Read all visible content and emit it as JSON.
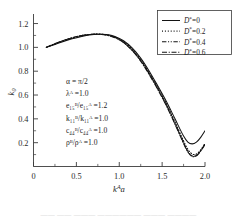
{
  "chart_data": {
    "type": "line",
    "title": "",
    "xlabel": "k^A a",
    "ylabel": "k0",
    "xlim": [
      0,
      2.0
    ],
    "ylim": [
      0.0,
      1.28
    ],
    "grid": false,
    "legend_position": "top-right",
    "x_ticks": [
      "0",
      "0.5",
      "1.0",
      "1.5",
      "2.0"
    ],
    "x_tick_values": [
      0,
      0.5,
      1.0,
      1.5,
      2.0
    ],
    "y_ticks": [
      "0.2",
      "0.4",
      "0.6",
      "0.8",
      "1.0",
      "1.2"
    ],
    "y_tick_values": [
      0.2,
      0.4,
      0.6,
      0.8,
      1.0,
      1.2
    ],
    "x": [
      0.15,
      0.25,
      0.35,
      0.45,
      0.55,
      0.65,
      0.75,
      0.85,
      0.95,
      1.05,
      1.15,
      1.25,
      1.35,
      1.45,
      1.55,
      1.65,
      1.75,
      1.8,
      1.85,
      1.9,
      1.95,
      2.0
    ],
    "series": [
      {
        "name": "D*=0",
        "style": "solid",
        "values": [
          1.0,
          1.025,
          1.05,
          1.072,
          1.09,
          1.103,
          1.11,
          1.108,
          1.092,
          1.055,
          0.995,
          0.91,
          0.8,
          0.675,
          0.545,
          0.4,
          0.255,
          0.205,
          0.19,
          0.205,
          0.245,
          0.3
        ]
      },
      {
        "name": "D*=0.2",
        "style": "dotted",
        "values": [
          1.0,
          1.028,
          1.055,
          1.078,
          1.095,
          1.107,
          1.112,
          1.107,
          1.088,
          1.048,
          0.985,
          0.898,
          0.787,
          0.662,
          0.528,
          0.375,
          0.215,
          0.145,
          0.105,
          0.105,
          0.14,
          0.195
        ]
      },
      {
        "name": "D*=0.4",
        "style": "dashdotdot",
        "values": [
          1.0,
          1.03,
          1.057,
          1.08,
          1.097,
          1.108,
          1.111,
          1.104,
          1.084,
          1.043,
          0.978,
          0.89,
          0.778,
          0.652,
          0.517,
          0.362,
          0.2,
          0.128,
          0.09,
          0.092,
          0.13,
          0.185
        ]
      },
      {
        "name": "D*=0.6",
        "style": "dashdot",
        "values": [
          1.0,
          1.031,
          1.058,
          1.081,
          1.098,
          1.108,
          1.11,
          1.102,
          1.081,
          1.039,
          0.973,
          0.884,
          0.771,
          0.645,
          0.509,
          0.354,
          0.193,
          0.122,
          0.085,
          0.09,
          0.132,
          0.19
        ]
      }
    ]
  },
  "legend": {
    "items": [
      {
        "label": "D*=0",
        "label_base": "D",
        "label_sup": "*",
        "label_value": "=0",
        "style": "solid"
      },
      {
        "label": "D*=0.2",
        "label_base": "D",
        "label_sup": "*",
        "label_value": "=0.2",
        "style": "dotted"
      },
      {
        "label": "D*=0.4",
        "label_base": "D",
        "label_sup": "*",
        "label_value": "=0.4",
        "style": "dashdotdot"
      },
      {
        "label": "D*=0.6",
        "label_base": "D",
        "label_sup": "*",
        "label_value": "=0.6",
        "style": "dashdot"
      }
    ]
  },
  "annotations": {
    "parameters": [
      {
        "id": "alpha",
        "text": "α = π/2"
      },
      {
        "id": "lambda-A",
        "text": "λᴬ =1.0"
      },
      {
        "id": "e15-ratio",
        "text": "e₁₅ᴮ/e₁₅ᴬ =1.2"
      },
      {
        "id": "k11-ratio",
        "text": "k₁₁ᴮ/k₁₁ᴬ =1.0"
      },
      {
        "id": "c44-ratio",
        "text": "c₄₄ᴮ/c₄₄ᴬ =1.0"
      },
      {
        "id": "rho-ratio",
        "text": "ρᴮ/ρᴬ =1.0"
      }
    ]
  },
  "axes": {
    "x_title_base": "k",
    "x_title_sup": "A",
    "x_title_tail": "a",
    "y_title_base": "k",
    "y_title_sub": "0"
  },
  "colors": {
    "curve": "#131313",
    "axis": "#3b3b3b",
    "text": "#1d1d1d",
    "background": "#ffffff"
  },
  "caption": {
    "text": "——  ——   ———  ——————  ———  ————"
  }
}
